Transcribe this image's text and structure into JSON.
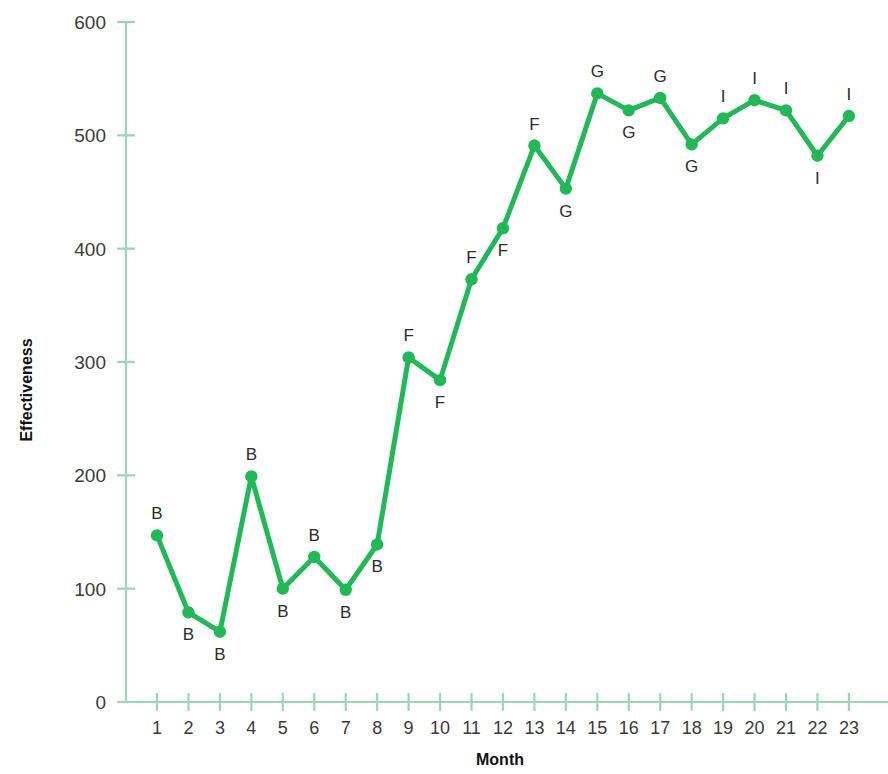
{
  "chart_data": {
    "type": "line",
    "title": "",
    "xlabel": "Month",
    "ylabel": "Effectiveness",
    "xlim": [
      1,
      23
    ],
    "ylim": [
      0,
      600
    ],
    "grid": false,
    "legend": "none",
    "x": [
      1,
      2,
      3,
      4,
      5,
      6,
      7,
      8,
      9,
      10,
      11,
      12,
      13,
      14,
      15,
      16,
      17,
      18,
      19,
      20,
      21,
      22,
      23
    ],
    "xtick_labels": [
      "1",
      "2",
      "3",
      "4",
      "5",
      "6",
      "7",
      "8",
      "9",
      "10",
      "11",
      "12",
      "13",
      "14",
      "15",
      "16",
      "17",
      "18",
      "19",
      "20",
      "21",
      "22",
      "23"
    ],
    "ytick_labels": [
      "0",
      "100",
      "200",
      "300",
      "400",
      "500",
      "600"
    ],
    "yticks": [
      0,
      100,
      200,
      300,
      400,
      500,
      600
    ],
    "series": [
      {
        "name": "Effectiveness",
        "color": "#22b858",
        "marker": "circle",
        "values": [
          147,
          79,
          62,
          199,
          100,
          128,
          99,
          139,
          304,
          284,
          373,
          418,
          491,
          453,
          537,
          522,
          533,
          492,
          515,
          531,
          522,
          482,
          517
        ]
      }
    ],
    "point_labels": [
      "B",
      "B",
      "B",
      "B",
      "B",
      "B",
      "B",
      "B",
      "F",
      "F",
      "F",
      "F",
      "F",
      "G",
      "G",
      "G",
      "G",
      "G",
      "I",
      "I",
      "I",
      "I",
      "I"
    ],
    "point_label_positions": [
      "above",
      "below",
      "below",
      "above",
      "below",
      "above",
      "below",
      "below",
      "above",
      "below",
      "above",
      "below",
      "above",
      "below",
      "above",
      "below",
      "above",
      "below",
      "above",
      "above",
      "above",
      "below",
      "above"
    ],
    "colors": {
      "line": "#22b858",
      "marker": "#22b858",
      "axis": "#9ad8b1",
      "tick_text": "#3b3b3b",
      "label_text": "#2b2b2b",
      "background": "#ffffff"
    }
  }
}
